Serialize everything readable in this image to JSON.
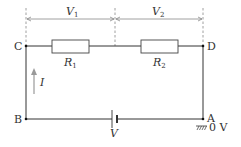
{
  "diagram": {
    "type": "series-circuit",
    "nodes": {
      "C": "C",
      "D": "D",
      "B": "B",
      "A": "A"
    },
    "resistors": [
      {
        "id": "R1",
        "symbol": "R",
        "subscript": "1"
      },
      {
        "id": "R2",
        "symbol": "R",
        "subscript": "2"
      }
    ],
    "voltages": [
      {
        "id": "V1",
        "symbol": "V",
        "subscript": "1"
      },
      {
        "id": "V2",
        "symbol": "V",
        "subscript": "2"
      }
    ],
    "source": {
      "label": "V"
    },
    "current": {
      "label": "I",
      "direction": "up"
    },
    "ground": {
      "label": "0 V",
      "node": "A"
    }
  }
}
